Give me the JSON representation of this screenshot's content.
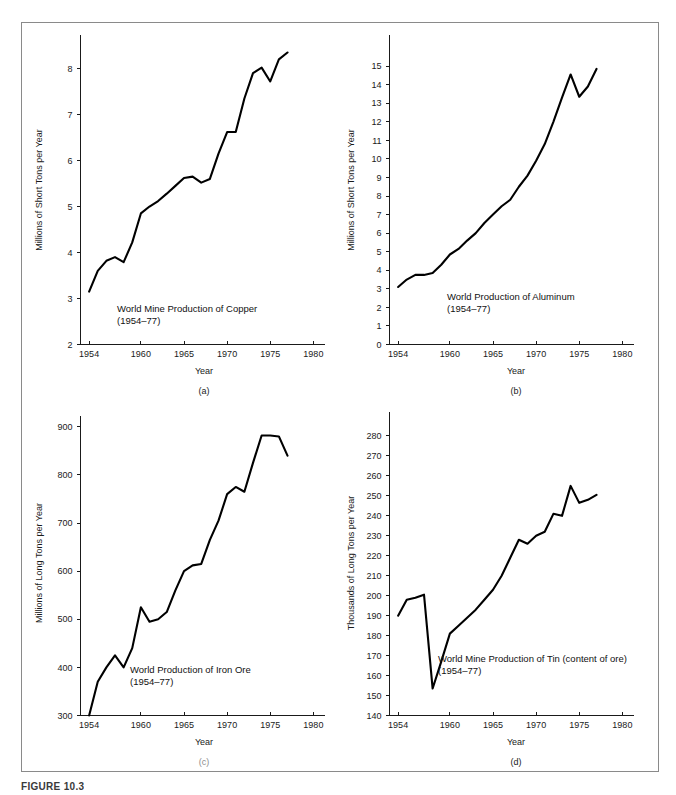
{
  "figure": {
    "caption": "FIGURE 10.3",
    "panels": [
      "(a)",
      "(b)",
      "(c)",
      "(d)"
    ]
  },
  "chart_data": [
    {
      "type": "line",
      "panel": "(a)",
      "title": "World Mine Production of Copper",
      "subtitle": "(1954–77)",
      "xlabel": "Year",
      "ylabel": "Millions of Short Tons per Year",
      "xlim": [
        1953,
        1981
      ],
      "ylim": [
        2,
        8.6
      ],
      "xticks": [
        1954,
        1960,
        1965,
        1970,
        1975,
        1980
      ],
      "xtick_labels": [
        "1954",
        "1960",
        "1965",
        "1970",
        "1975",
        "1980"
      ],
      "yticks": [
        2,
        3,
        4,
        5,
        6,
        7,
        8
      ],
      "ytick_labels": [
        "2",
        "3",
        "4",
        "5",
        "6",
        "7",
        "8"
      ],
      "grid": false,
      "legend": "none",
      "x": [
        1954,
        1955,
        1956,
        1957,
        1958,
        1959,
        1960,
        1961,
        1962,
        1963,
        1964,
        1965,
        1966,
        1967,
        1968,
        1969,
        1970,
        1971,
        1972,
        1973,
        1974,
        1975,
        1976,
        1977
      ],
      "values": [
        3.15,
        3.6,
        3.82,
        3.9,
        3.79,
        4.22,
        4.85,
        5.0,
        5.12,
        5.28,
        5.45,
        5.62,
        5.65,
        5.52,
        5.6,
        6.15,
        6.62,
        6.62,
        7.35,
        7.9,
        8.02,
        7.72,
        8.2,
        8.35
      ]
    },
    {
      "type": "line",
      "panel": "(b)",
      "title": "World Production of Aluminum",
      "subtitle": "(1954–77)",
      "xlabel": "Year",
      "ylabel": "Millions of Short Tons per Year",
      "xlim": [
        1953,
        1981
      ],
      "ylim": [
        0,
        15.6
      ],
      "xticks": [
        1954,
        1960,
        1965,
        1970,
        1975,
        1980
      ],
      "xtick_labels": [
        "1954",
        "1960",
        "1965",
        "1970",
        "1975",
        "1980"
      ],
      "yticks": [
        0,
        1,
        2,
        3,
        4,
        5,
        6,
        7,
        8,
        9,
        10,
        11,
        12,
        13,
        14,
        15
      ],
      "ytick_labels": [
        "0",
        "1",
        "2",
        "3",
        "4",
        "5",
        "6",
        "7",
        "8",
        "9",
        "10",
        "11",
        "12",
        "13",
        "14",
        "15"
      ],
      "grid": false,
      "legend": "none",
      "x": [
        1954,
        1955,
        1956,
        1957,
        1958,
        1959,
        1960,
        1961,
        1962,
        1963,
        1964,
        1965,
        1966,
        1967,
        1968,
        1969,
        1970,
        1971,
        1972,
        1973,
        1974,
        1975,
        1976,
        1977
      ],
      "values": [
        3.1,
        3.5,
        3.75,
        3.75,
        3.85,
        4.3,
        4.85,
        5.15,
        5.6,
        6.0,
        6.55,
        7.0,
        7.45,
        7.8,
        8.5,
        9.1,
        9.9,
        10.8,
        12.0,
        13.3,
        14.55,
        13.35,
        13.9,
        14.85
      ]
    },
    {
      "type": "line",
      "panel": "(c)",
      "title": "World Production of Iron Ore",
      "subtitle": "(1954–77)",
      "xlabel": "Year",
      "ylabel": "Millions of Long Tons per Year",
      "xlim": [
        1953,
        1981
      ],
      "ylim": [
        300,
        910
      ],
      "xticks": [
        1954,
        1960,
        1965,
        1970,
        1975,
        1980
      ],
      "xtick_labels": [
        "1954",
        "1960",
        "1965",
        "1970",
        "1975",
        "1980"
      ],
      "yticks": [
        300,
        400,
        500,
        600,
        700,
        800,
        900
      ],
      "ytick_labels": [
        "300",
        "400",
        "500",
        "600",
        "700",
        "800",
        "900"
      ],
      "grid": false,
      "legend": "none",
      "x": [
        1954,
        1955,
        1956,
        1957,
        1958,
        1959,
        1960,
        1961,
        1962,
        1963,
        1964,
        1965,
        1966,
        1967,
        1968,
        1969,
        1970,
        1971,
        1972,
        1973,
        1974,
        1975,
        1976,
        1977
      ],
      "values": [
        300,
        370,
        400,
        425,
        400,
        440,
        525,
        495,
        500,
        515,
        560,
        600,
        612,
        615,
        665,
        705,
        760,
        775,
        765,
        825,
        882,
        882,
        880,
        840
      ]
    },
    {
      "type": "line",
      "panel": "(d)",
      "title": "World Mine Production of Tin (content of ore)",
      "subtitle": "(1954–77)",
      "xlabel": "Year",
      "ylabel": "Thousands of Long Tons per Year",
      "xlim": [
        1953,
        1981
      ],
      "ylim": [
        140,
        288
      ],
      "xticks": [
        1954,
        1960,
        1965,
        1970,
        1975,
        1980
      ],
      "xtick_labels": [
        "1954",
        "1960",
        "1965",
        "1970",
        "1975",
        "1980"
      ],
      "yticks": [
        140,
        150,
        160,
        170,
        180,
        190,
        200,
        210,
        220,
        230,
        240,
        250,
        260,
        270,
        280
      ],
      "ytick_labels": [
        "140",
        "150",
        "160",
        "170",
        "180",
        "190",
        "200",
        "210",
        "220",
        "230",
        "240",
        "250",
        "260",
        "270",
        "280"
      ],
      "grid": false,
      "legend": "none",
      "x": [
        1954,
        1955,
        1956,
        1957,
        1958,
        1959,
        1960,
        1961,
        1962,
        1963,
        1964,
        1965,
        1966,
        1967,
        1968,
        1969,
        1970,
        1971,
        1972,
        1973,
        1974,
        1975,
        1976,
        1977
      ],
      "values": [
        190,
        198,
        199,
        200.5,
        153.5,
        167,
        181,
        185,
        189,
        193,
        198,
        203,
        210,
        219,
        228,
        226,
        230,
        232,
        241,
        240,
        255,
        246.5,
        248,
        250.5
      ]
    }
  ]
}
